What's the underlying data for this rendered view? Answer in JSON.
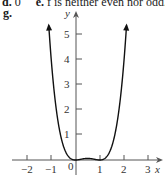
{
  "header": {
    "prev_answer_d_label": "d.",
    "prev_answer_d_value": "0",
    "prev_answer_e_label": "e.",
    "prev_answer_e_text": "f is neither even nor odd.",
    "part_label": "g."
  },
  "chart_data": {
    "type": "line",
    "title": "",
    "function": "f(x) = x^2 (x - 1)^2",
    "xlabel": "x",
    "ylabel": "y",
    "xlim": [
      -2.5,
      3.5
    ],
    "ylim": [
      0,
      5.8
    ],
    "x_ticks": [
      -2,
      -1,
      0,
      1,
      2,
      3
    ],
    "x_tick_labels": [
      "−2",
      "−1",
      "0",
      "1",
      "2",
      "3"
    ],
    "y_ticks": [
      1,
      2,
      3,
      4,
      5
    ],
    "y_tick_labels": [
      "1",
      "2",
      "3",
      "4",
      "5"
    ],
    "grid": false,
    "legend": null,
    "series": [
      {
        "name": "f",
        "x": [
          -1.1,
          -1.0,
          -0.8,
          -0.6,
          -0.4,
          -0.2,
          0,
          0.25,
          0.5,
          0.75,
          1.0,
          1.2,
          1.4,
          1.6,
          1.8,
          2.0,
          2.1
        ],
        "y": [
          5.34,
          4.0,
          2.07,
          0.92,
          0.31,
          0.06,
          0,
          0.035,
          0.0625,
          0.035,
          0,
          0.06,
          0.31,
          0.92,
          2.07,
          4.0,
          5.34
        ]
      }
    ],
    "annotations": [
      "Both ends of the curve have arrowheads (continues upward)"
    ]
  }
}
